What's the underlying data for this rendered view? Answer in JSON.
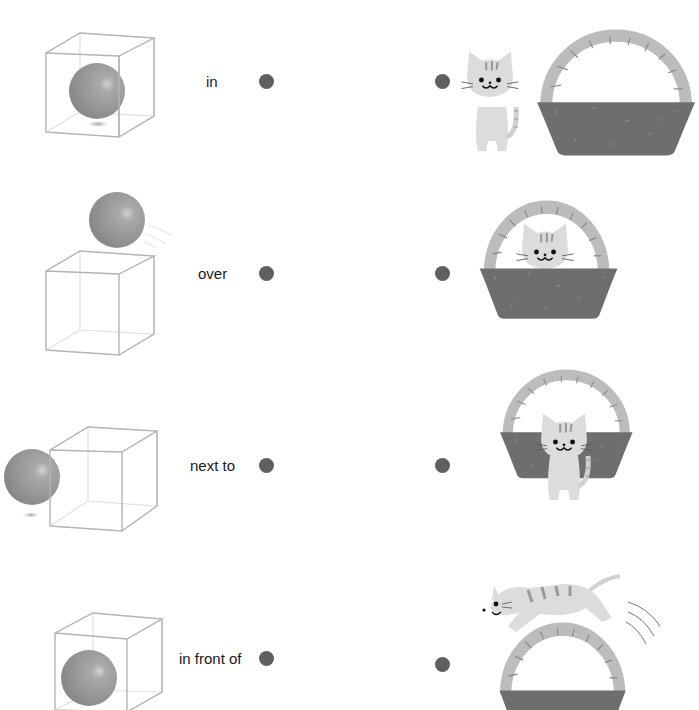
{
  "worksheet": {
    "type": "matching exercise",
    "rows": [
      {
        "word": "in",
        "left_picture": "ball inside cube",
        "right_picture": "cat next to basket"
      },
      {
        "word": "over",
        "left_picture": "ball over cube",
        "right_picture": "cat in basket"
      },
      {
        "word": "next to",
        "left_picture": "ball next to cube",
        "right_picture": "cat in front of basket"
      },
      {
        "word": "in front of",
        "left_picture": "ball in front of cube",
        "right_picture": "cat jumping over basket"
      }
    ]
  },
  "colors": {
    "dot": "#5f5f5f",
    "ball": "#8f8f8f",
    "cube_line": "#b5b5b5",
    "basket_body": "#6f6f6f",
    "basket_handle": "#bdbdbd",
    "cat": "#d8d8d8"
  }
}
